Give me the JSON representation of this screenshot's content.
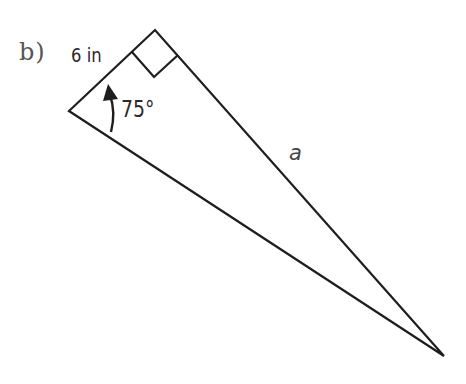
{
  "problem": {
    "part_label": "b)"
  },
  "triangle": {
    "type": "right-triangle",
    "vertices": {
      "left": [
        69,
        111
      ],
      "top_right_angle": [
        155,
        30
      ],
      "bottom_right": [
        444,
        356
      ]
    },
    "right_angle_marker": {
      "points": [
        [
          132,
          52
        ],
        [
          154,
          77
        ],
        [
          178,
          55
        ]
      ]
    },
    "side_labels": {
      "short_leg": "6 in",
      "hypotenuse_side": "a"
    },
    "angle": {
      "label": "75°",
      "vertex": "left",
      "arc_direction": "counterclockwise-arrow"
    },
    "stroke_color": "#1e1e1e",
    "stroke_width": 2.2
  }
}
